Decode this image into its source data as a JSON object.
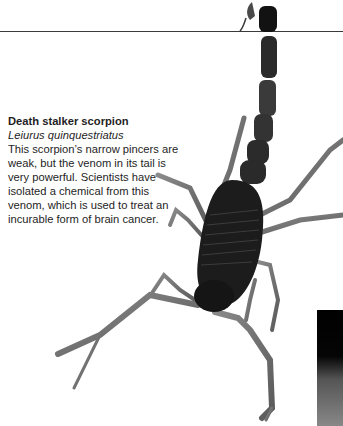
{
  "caption": {
    "title": "Death stalker scorpion",
    "latin_name": "Leiurus quinquestriatus",
    "body": "This scorpion’s narrow pincers are weak, but the venom in its tail is very powerful. Scientists have isolated a chemical from this venom, which is used to treat an incurable form of brain cancer."
  },
  "images": {
    "main": "death-stalker-scorpion-photo",
    "side": "partial-dark-photo"
  },
  "colors": {
    "text": "#1e1e1e",
    "rule": "#3a3a3a",
    "scorpion_dark": "#1a1a1a",
    "scorpion_mid": "#555555",
    "scorpion_light": "#9a9a9a"
  }
}
